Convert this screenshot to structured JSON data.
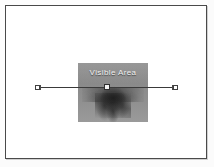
{
  "canvas": {
    "width": 214,
    "height": 167,
    "background_color": "#ffffff",
    "frame_border_color": "#4a4a4a"
  },
  "document_frame": {
    "name": "page-frame",
    "label": ""
  },
  "media": {
    "label": "Visible Area",
    "label_color": "#f2f2f2",
    "fill_color": "#8d8d8d",
    "description_alt": "grayscale flower photograph",
    "left": 72,
    "top": 57,
    "width": 70,
    "height": 59
  },
  "selection": {
    "line_color": "#3a3a3a",
    "handle_fill": "#ffffff",
    "handle_border": "#404040",
    "left_handle_x": 35,
    "center_handle_x": 104,
    "right_handle_x": 173,
    "line_y": 87
  }
}
